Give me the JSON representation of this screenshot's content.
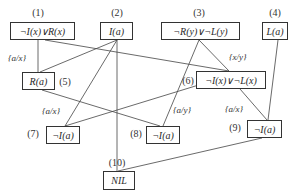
{
  "diagram": {
    "type": "resolution-refutation-tree",
    "nodes": [
      {
        "id": "1",
        "label": "(1)",
        "clause": "¬I(x)∨R(x)"
      },
      {
        "id": "2",
        "label": "(2)",
        "clause": "I(a)"
      },
      {
        "id": "3",
        "label": "(3)",
        "clause": "¬R(y)∨¬L(y)"
      },
      {
        "id": "4",
        "label": "(4)",
        "clause": "L(a)"
      },
      {
        "id": "5",
        "label": "(5)",
        "clause": "R(a)"
      },
      {
        "id": "6",
        "label": "(6)",
        "clause": "¬I(x)∨¬L(x)"
      },
      {
        "id": "7",
        "label": "(7)",
        "clause": "¬I(a)"
      },
      {
        "id": "8",
        "label": "(8)",
        "clause": "¬I(a)"
      },
      {
        "id": "9",
        "label": "(9)",
        "clause": "¬I(a)"
      },
      {
        "id": "10",
        "label": "(10)",
        "clause": "NIL"
      }
    ],
    "substitutions": [
      {
        "id": "s1",
        "text": "{a/x}",
        "edge": "1-5"
      },
      {
        "id": "s2",
        "text": "{x/y}",
        "edge": "3-6"
      },
      {
        "id": "s3",
        "text": "{a/x}",
        "edge": "7"
      },
      {
        "id": "s4",
        "text": "{a/y}",
        "edge": "8"
      },
      {
        "id": "s5",
        "text": "{a/x}",
        "edge": "9"
      }
    ],
    "edges": [
      [
        "1",
        "5"
      ],
      [
        "2",
        "5"
      ],
      [
        "1",
        "6"
      ],
      [
        "3",
        "6"
      ],
      [
        "2",
        "7"
      ],
      [
        "3",
        "7"
      ],
      [
        "5",
        "8"
      ],
      [
        "6",
        "8"
      ],
      [
        "6",
        "9"
      ],
      [
        "4",
        "9"
      ],
      [
        "2",
        "10"
      ],
      [
        "9",
        "10"
      ],
      [
        "2",
        "8"
      ],
      [
        "5",
        "7"
      ]
    ],
    "line_color": "#333333"
  }
}
